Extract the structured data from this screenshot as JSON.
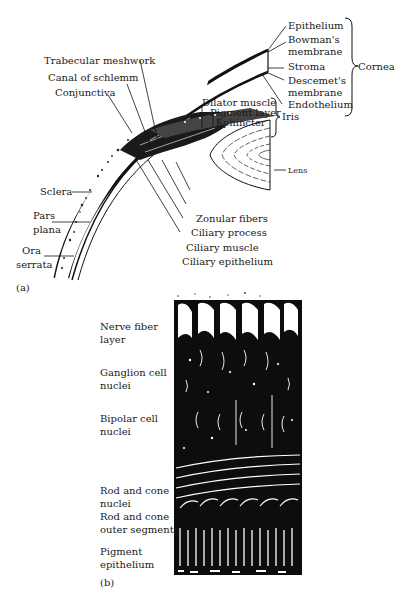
{
  "panel_a": {
    "tag": "(a)",
    "labels": {
      "epithelium": "Epithelium",
      "bowmans_1": "Bowman's",
      "bowmans_2": "membrane",
      "stroma": "Stroma",
      "descemets_1": "Descemet's",
      "descemets_2": "membrane",
      "endothelium": "Endothelium",
      "cornea": "Cornea",
      "trabecular": "Trabecular meshwork",
      "canal": "Canal of schlemm",
      "conjunctiva": "Conjunctiva",
      "dilator": "Dilator muscle",
      "pigment_layer": "Pigment layer",
      "sphincter": "Sphincter",
      "iris": "Iris",
      "lens": "Lens",
      "sclera": "Sclera",
      "pars_1": "Pars",
      "pars_2": "plana",
      "ora_1": "Ora",
      "ora_2": "serrata",
      "zonular": "Zonular fibers",
      "ciliary_process": "Ciliary process",
      "ciliary_muscle": "Ciliary muscle",
      "ciliary_epithelium": "Ciliary epithelium"
    }
  },
  "panel_b": {
    "tag": "(b)",
    "layers": [
      {
        "line1": "Nerve fiber",
        "line2": "layer"
      },
      {
        "line1": "Ganglion cell",
        "line2": "nuclei"
      },
      {
        "line1": "Bipolar cell",
        "line2": "nuclei"
      },
      {
        "line1": "Rod and cone",
        "line2": "nuclei"
      },
      {
        "line1": "Rod and cone",
        "line2": "outer segments"
      },
      {
        "line1": "Pigment",
        "line2": "epithelium"
      }
    ]
  }
}
